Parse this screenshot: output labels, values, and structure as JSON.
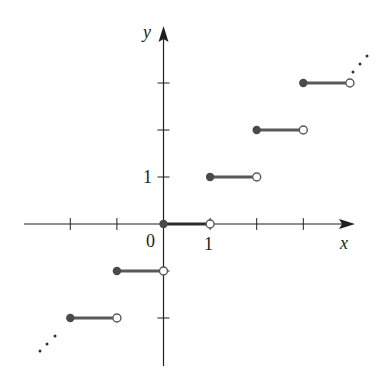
{
  "chart_data": {
    "type": "line",
    "subtype": "step-function (greatest integer function)",
    "title": "",
    "xlabel": "x",
    "ylabel": "y",
    "xlim": [
      -2.0,
      4.0
    ],
    "ylim": [
      -3.0,
      4.1
    ],
    "origin_label": "0",
    "x_tick_labels": [
      {
        "value": 1,
        "label": "1"
      }
    ],
    "y_tick_labels": [
      {
        "value": 1,
        "label": "1"
      }
    ],
    "x_ticks": [
      -2,
      -1,
      0,
      1,
      2,
      3
    ],
    "y_ticks": [
      -2,
      -1,
      0,
      1,
      2,
      3
    ],
    "grid": false,
    "legend": null,
    "segments": [
      {
        "x_start": -2,
        "x_end": -1,
        "y": -2,
        "start": "closed",
        "end": "open"
      },
      {
        "x_start": -1,
        "x_end": 0,
        "y": -1,
        "start": "closed",
        "end": "open"
      },
      {
        "x_start": 0,
        "x_end": 1,
        "y": 0,
        "start": "closed",
        "end": "open"
      },
      {
        "x_start": 1,
        "x_end": 2,
        "y": 1,
        "start": "closed",
        "end": "open"
      },
      {
        "x_start": 2,
        "x_end": 3,
        "y": 2,
        "start": "closed",
        "end": "open"
      },
      {
        "x_start": 3,
        "x_end": 4,
        "y": 3,
        "start": "closed",
        "end": "open"
      }
    ],
    "annotations": [
      {
        "text": "...",
        "position": "lower-left",
        "meaning": "pattern continues"
      },
      {
        "text": "...",
        "position": "upper-right",
        "meaning": "pattern continues"
      }
    ],
    "colors": {
      "axis": "#231f20",
      "segment": "#58585a",
      "closed_dot": "#4a4a4c",
      "open_dot_fill": "#ffffff"
    }
  },
  "labels": {
    "x_axis": "x",
    "y_axis": "y",
    "origin": "0",
    "x_one": "1",
    "y_one": "1"
  }
}
